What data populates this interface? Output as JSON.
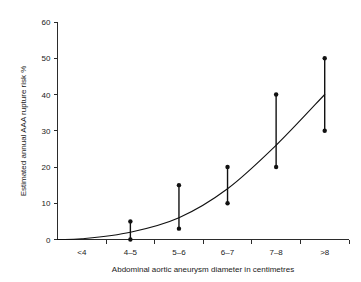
{
  "chart_data": {
    "type": "line",
    "title": "",
    "subtitle": "",
    "xlabel": "Abdominal aortic aneurysm diameter in centimetres",
    "ylabel": "Estimated annual AAA rupture risk %",
    "categories": [
      "<4",
      "4–5",
      "5–6",
      "6–7",
      "7–8",
      ">8"
    ],
    "ylim": [
      0,
      60
    ],
    "yticks": [
      0,
      10,
      20,
      30,
      40,
      50,
      60
    ],
    "ytick_labels": [
      "0",
      "10",
      "20",
      "30",
      "40",
      "50",
      "60"
    ],
    "grid": false,
    "legend": null,
    "legend_position": "none",
    "series": [
      {
        "name": "Fitted rupture risk curve",
        "values": [
          0.2,
          2.0,
          6.0,
          14.0,
          26.0,
          40.0
        ]
      },
      {
        "name": "Reported risk range",
        "type": "errorbar",
        "low": [
          null,
          0.0,
          3.0,
          10.0,
          20.0,
          30.0
        ],
        "high": [
          null,
          5.0,
          15.0,
          20.0,
          40.0,
          50.0
        ]
      }
    ],
    "annotations": []
  },
  "axes": {
    "y_title": "Estimated annual AAA rupture risk %",
    "x_title": "Abdominal aortic aneurysm diameter in centimetres"
  },
  "colors": {
    "curve": "#111111",
    "errorbar": "#111111",
    "axis": "#2b2b2b",
    "background": "#ffffff",
    "text": "#1a1a1a"
  }
}
